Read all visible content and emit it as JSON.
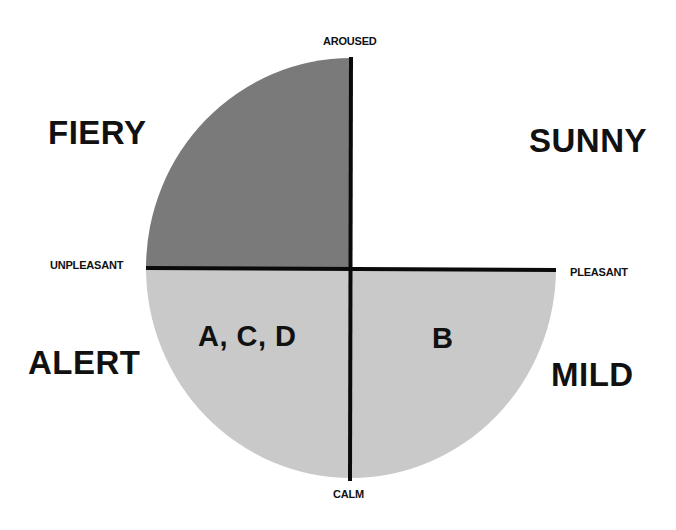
{
  "diagram": {
    "type": "mood-quadrant-circle",
    "axes": {
      "top": "AROUSED",
      "bottom": "CALM",
      "left": "UNPLEASANT",
      "right": "PLEASANT"
    },
    "quadrants": {
      "top_left": {
        "name": "FIERY",
        "fill": "#7a7a7a",
        "items": ""
      },
      "top_right": {
        "name": "SUNNY",
        "fill": "#ffffff",
        "items": ""
      },
      "bottom_left": {
        "name": "ALERT",
        "fill": "#c9c9c9",
        "items": "A, C, D"
      },
      "bottom_right": {
        "name": "MILD",
        "fill": "#c9c9c9",
        "items": "B"
      }
    },
    "colors": {
      "axis_line": "#0a0a0a",
      "text": "#111111",
      "background": "#ffffff"
    }
  }
}
